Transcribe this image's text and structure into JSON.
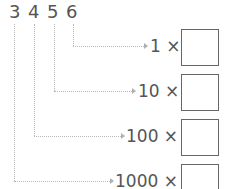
{
  "digits": [
    "3",
    "4",
    "5",
    "6"
  ],
  "rows": [
    {
      "label": "1 ×",
      "digit_index": 3
    },
    {
      "label": "10 ×",
      "digit_index": 2
    },
    {
      "label": "100 ×",
      "digit_index": 1
    },
    {
      "label": "1000 ×",
      "digit_index": 0
    }
  ],
  "colors": {
    "text": "#555555",
    "connector": "#b8b8b8",
    "box_border": "#666666"
  }
}
